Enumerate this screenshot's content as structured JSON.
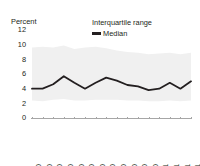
{
  "chart_data": {
    "type": "line",
    "title": "",
    "ylabel": "Percent",
    "xlabel": "",
    "ylim": [
      0,
      12
    ],
    "yticks": [
      0,
      2,
      4,
      6,
      8,
      10,
      12
    ],
    "grid": false,
    "legend_position": "top-right",
    "categories": [
      "Jan-20",
      "Feb-20",
      "Mar-20",
      "Apr-20",
      "May-20",
      "Jun-20",
      "Jul-20",
      "Aug-20",
      "Sep-20",
      "Oct-20",
      "Nov-20",
      "Dec-20",
      "Jan-21",
      "Feb-21",
      "Mar-21",
      "Apr-21"
    ],
    "series": [
      {
        "name": "Median",
        "type": "line",
        "color": "#231f20",
        "values": [
          4.0,
          4.0,
          4.6,
          5.7,
          4.8,
          4.0,
          4.8,
          5.5,
          5.1,
          4.5,
          4.3,
          3.8,
          4.0,
          4.8,
          4.0,
          5.0
        ]
      },
      {
        "name": "Interquartile range",
        "type": "band",
        "color": "#f0f0f0",
        "upper": [
          9.6,
          9.7,
          9.6,
          9.9,
          9.4,
          9.6,
          9.7,
          9.5,
          9.2,
          9.0,
          8.9,
          8.7,
          8.8,
          8.9,
          8.7,
          8.9
        ],
        "lower": [
          2.4,
          2.3,
          2.5,
          2.6,
          2.4,
          2.4,
          2.5,
          2.5,
          2.5,
          2.4,
          2.4,
          2.3,
          2.3,
          2.4,
          2.3,
          2.4
        ]
      }
    ],
    "legend": [
      {
        "label": "Interquartile range",
        "marker": "band",
        "color": "#f0f0f0"
      },
      {
        "label": "Median",
        "marker": "line",
        "color": "#231f20"
      }
    ]
  }
}
